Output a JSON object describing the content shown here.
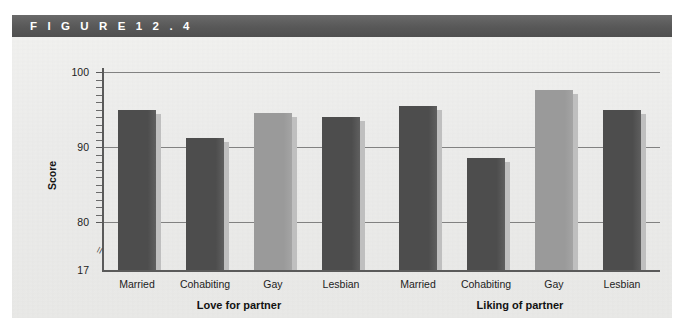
{
  "figure": {
    "header_label": "F I G U R E   1 2 . 4",
    "panel_bg": "#eeeeec",
    "header_bg": "#5c5c5c"
  },
  "chart_data": {
    "type": "bar",
    "title": "",
    "xlabel": "",
    "ylabel": "Score",
    "ylim": [
      17,
      102
    ],
    "y_ticks": [
      {
        "label": "100",
        "value": 100
      },
      {
        "label": "90",
        "value": 90
      },
      {
        "label": "80",
        "value": 80
      },
      {
        "label": "17",
        "value": 17
      }
    ],
    "axis_break": true,
    "axis_break_between": [
      17,
      80
    ],
    "grid": "horizontal",
    "legend": "none",
    "categories": [
      "Married",
      "Cohabiting",
      "Gay",
      "Lesbian"
    ],
    "groups": [
      {
        "name": "Love for partner",
        "bars": [
          {
            "category": "Married",
            "value": 95.0,
            "color": "#4d4d4d"
          },
          {
            "category": "Cohabiting",
            "value": 91.2,
            "color": "#4d4d4d"
          },
          {
            "category": "Gay",
            "value": 94.6,
            "color": "#9a9a9a"
          },
          {
            "category": "Lesbian",
            "value": 94.0,
            "color": "#4d4d4d"
          }
        ]
      },
      {
        "name": "Liking of partner",
        "bars": [
          {
            "category": "Married",
            "value": 95.4,
            "color": "#4d4d4d"
          },
          {
            "category": "Cohabiting",
            "value": 88.5,
            "color": "#4d4d4d"
          },
          {
            "category": "Gay",
            "value": 97.6,
            "color": "#9a9a9a"
          },
          {
            "category": "Lesbian",
            "value": 95.0,
            "color": "#4d4d4d"
          }
        ]
      }
    ],
    "colors": {
      "bar_dark": "#4d4d4d",
      "bar_light": "#9a9a9a",
      "bar_shadow": "#bfbfbf",
      "gridline": "#6f6f6f",
      "axis": "#5a5a5a"
    }
  }
}
